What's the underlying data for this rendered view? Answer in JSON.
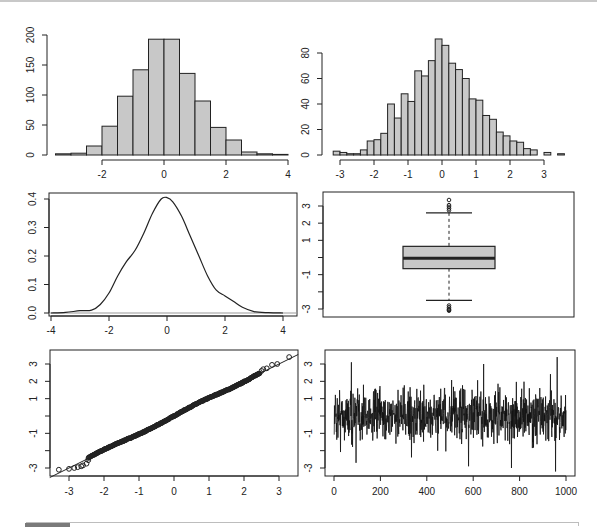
{
  "chart_data": [
    {
      "type": "bar",
      "subtype": "histogram",
      "panel": "top-left",
      "title": "",
      "bin_width": 0.5,
      "bin_start": -3.5,
      "values": [
        2,
        3,
        15,
        48,
        98,
        142,
        193,
        193,
        136,
        90,
        46,
        25,
        5,
        2,
        1
      ],
      "x_ticks": [
        "-2",
        "0",
        "2",
        "4"
      ],
      "y_ticks": [
        "0",
        "50",
        "100",
        "150",
        "200"
      ],
      "xlim": [
        -3.5,
        4
      ],
      "ylim": [
        0,
        200
      ],
      "fill": "#c8c8c8"
    },
    {
      "type": "bar",
      "subtype": "histogram",
      "panel": "top-right",
      "title": "",
      "bin_width": 0.2,
      "bin_start": -3.2,
      "values": [
        3,
        2,
        1,
        1,
        4,
        11,
        12,
        17,
        40,
        29,
        48,
        42,
        66,
        62,
        74,
        91,
        86,
        72,
        67,
        60,
        44,
        43,
        31,
        28,
        18,
        15,
        11,
        10,
        5,
        4,
        0,
        2,
        0,
        1
      ],
      "x_ticks": [
        "-3",
        "-2",
        "-1",
        "0",
        "1",
        "2",
        "3"
      ],
      "y_ticks": [
        "0",
        "20",
        "40",
        "60",
        "80"
      ],
      "xlim": [
        -3.2,
        3.6
      ],
      "ylim": [
        0,
        90
      ],
      "fill": "#c8c8c8"
    },
    {
      "type": "line",
      "subtype": "density",
      "panel": "middle-left",
      "x": [
        -4.0,
        -3.5,
        -3.0,
        -2.6,
        -2.3,
        -2.0,
        -1.7,
        -1.4,
        -1.1,
        -0.8,
        -0.5,
        -0.2,
        0.0,
        0.2,
        0.5,
        0.8,
        1.1,
        1.4,
        1.7,
        2.0,
        2.3,
        2.6,
        3.0,
        3.5,
        4.0
      ],
      "y": [
        0.0,
        0.002,
        0.008,
        0.01,
        0.03,
        0.07,
        0.13,
        0.18,
        0.22,
        0.28,
        0.35,
        0.4,
        0.405,
        0.39,
        0.34,
        0.27,
        0.2,
        0.13,
        0.08,
        0.06,
        0.04,
        0.02,
        0.005,
        0.001,
        0.0
      ],
      "x_ticks": [
        "-4",
        "-2",
        "0",
        "2",
        "4"
      ],
      "y_ticks": [
        "0.0",
        "0.1",
        "0.2",
        "0.3",
        "0.4"
      ],
      "xlim": [
        -4.2,
        4.4
      ],
      "ylim": [
        0,
        0.42
      ],
      "baseline": 0
    },
    {
      "type": "boxplot",
      "panel": "middle-right",
      "horizontal": false,
      "q1": -0.65,
      "median": -0.05,
      "q3": 0.65,
      "whisker_low": -2.5,
      "whisker_high": 2.6,
      "outliers_high": [
        2.75,
        2.85,
        2.95,
        3.05,
        3.35
      ],
      "outliers_low": [
        -2.8,
        -2.9,
        -3.0,
        -3.05,
        -3.1
      ],
      "y_ticks": [
        "3",
        "2",
        "1",
        "",
        "-1",
        "",
        "-3"
      ],
      "ylim": [
        -3.3,
        3.6
      ],
      "fill": "#c8c8c8"
    },
    {
      "type": "scatter",
      "subtype": "qqplot",
      "panel": "bottom-left",
      "x_ticks": [
        "-3",
        "-2",
        "-1",
        "0",
        "1",
        "2",
        "3"
      ],
      "y_ticks": [
        "3",
        "2",
        "1",
        "",
        "-1",
        "",
        "-3"
      ],
      "xlim": [
        -3.5,
        3.5
      ],
      "ylim": [
        -3.3,
        3.6
      ],
      "reference_line": {
        "slope": 1.0,
        "intercept": 0.0
      },
      "tail_points_low": [
        [
          -3.29,
          -3.1
        ],
        [
          -3.0,
          -3.05
        ],
        [
          -2.85,
          -3.0
        ],
        [
          -2.75,
          -2.95
        ],
        [
          -2.65,
          -2.9
        ],
        [
          -2.6,
          -2.85
        ],
        [
          -2.5,
          -2.75
        ],
        [
          -2.45,
          -2.55
        ]
      ],
      "tail_points_high": [
        [
          2.5,
          2.6
        ],
        [
          2.55,
          2.7
        ],
        [
          2.65,
          2.75
        ],
        [
          2.8,
          2.95
        ],
        [
          2.95,
          3.0
        ],
        [
          3.29,
          3.4
        ]
      ]
    },
    {
      "type": "line",
      "subtype": "time-series",
      "panel": "bottom-right",
      "n": 1000,
      "x_ticks": [
        "0",
        "200",
        "400",
        "600",
        "800",
        "1000"
      ],
      "y_ticks": [
        "3",
        "2",
        "1",
        "",
        "-1",
        "",
        "-3"
      ],
      "xlim": [
        -40,
        1040
      ],
      "ylim": [
        -3.3,
        3.6
      ],
      "notable_extremes": [
        {
          "x": 75,
          "y": 3.1
        },
        {
          "x": 95,
          "y": -2.7
        },
        {
          "x": 580,
          "y": -2.9
        },
        {
          "x": 645,
          "y": 3.0
        },
        {
          "x": 765,
          "y": -3.0
        },
        {
          "x": 955,
          "y": -3.2
        },
        {
          "x": 962,
          "y": 3.4
        }
      ]
    }
  ],
  "ui": {
    "bottom_bar": {
      "tab_color": "#7a7a7a",
      "border_color": "#bdbdbd"
    }
  }
}
